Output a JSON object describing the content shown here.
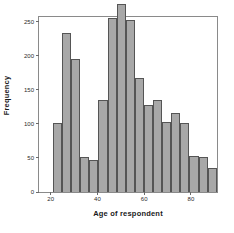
{
  "chart_data": {
    "type": "bar",
    "title": "",
    "subtitle": "",
    "xlabel": "Age of respondent",
    "ylabel": "Frequency",
    "grid": false,
    "legend": null,
    "ylim": [
      0,
      260
    ],
    "xlim": [
      15,
      92
    ],
    "ytick_labels": [
      "0",
      "50",
      "100",
      "150",
      "200",
      "250"
    ],
    "ytick_values": [
      0,
      50,
      100,
      150,
      200,
      250
    ],
    "xtick_labels": [
      "20",
      "40",
      "60",
      "80"
    ],
    "xtick_values": [
      20,
      40,
      60,
      80
    ],
    "bin_width": 4,
    "bin_starts": [
      18,
      22,
      26,
      30,
      34,
      38,
      42,
      46,
      50,
      54,
      58,
      62,
      66,
      70,
      74,
      78,
      82,
      86
    ],
    "categories": [
      "18",
      "22",
      "26",
      "30",
      "34",
      "38",
      "42",
      "46",
      "50",
      "54",
      "58",
      "62",
      "66",
      "70",
      "74",
      "78",
      "82",
      "86"
    ],
    "values": [
      101,
      233,
      196,
      51,
      47,
      135,
      255,
      276,
      252,
      167,
      128,
      135,
      103,
      116,
      101,
      53,
      51,
      36
    ],
    "bar_color": "#a8a8a8",
    "bar_edge_color": "#555555",
    "frame_color": "#8a8a8a",
    "background": "#ffffff"
  }
}
